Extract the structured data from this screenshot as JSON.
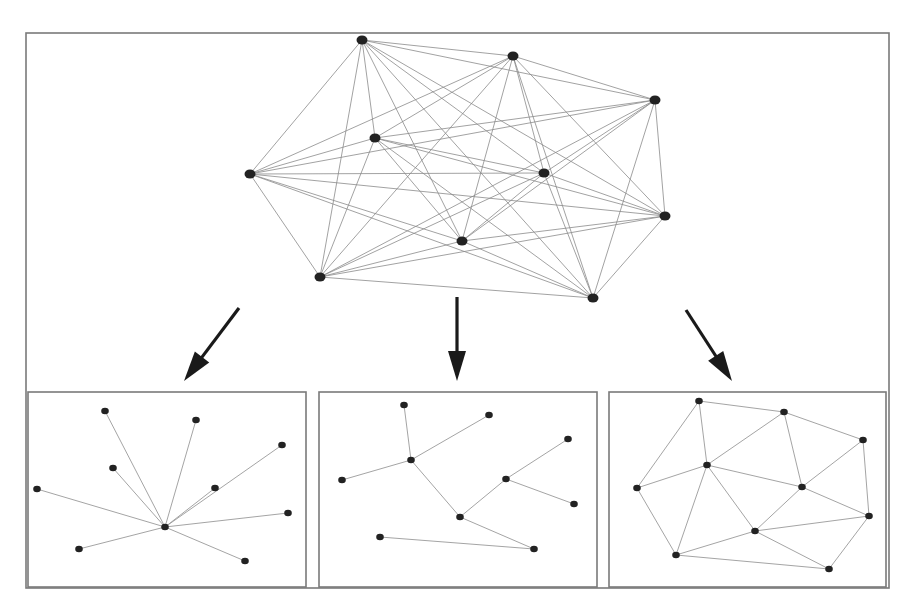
{
  "diagram": {
    "title": "",
    "colors": {
      "node": "#222222",
      "edge": "#8a8a8a",
      "frame": "#7a7a7a",
      "arrow": "#1a1a1a"
    },
    "source_graph": {
      "name": "complete-graph",
      "node_count": 10,
      "edge_type": "complete",
      "nodes": [
        {
          "id": "n0"
        },
        {
          "id": "n1"
        },
        {
          "id": "n2"
        },
        {
          "id": "n3"
        },
        {
          "id": "n4"
        },
        {
          "id": "n5"
        },
        {
          "id": "n6"
        },
        {
          "id": "n7"
        },
        {
          "id": "n8"
        },
        {
          "id": "n9"
        }
      ]
    },
    "arrows": [
      {
        "id": "arrow-left",
        "direction": "down-left",
        "target": "star-graph"
      },
      {
        "id": "arrow-middle",
        "direction": "down",
        "target": "tree-graph"
      },
      {
        "id": "arrow-right",
        "direction": "down-right",
        "target": "triangulation-graph"
      }
    ],
    "subgraphs": [
      {
        "name": "star-graph",
        "node_count": 10,
        "edges": [
          [
            0,
            1
          ],
          [
            0,
            2
          ],
          [
            0,
            3
          ],
          [
            0,
            4
          ],
          [
            0,
            5
          ],
          [
            0,
            6
          ],
          [
            0,
            7
          ],
          [
            0,
            8
          ],
          [
            0,
            9
          ]
        ]
      },
      {
        "name": "tree-graph",
        "node_count": 10,
        "edges": [
          [
            0,
            3
          ],
          [
            1,
            3
          ],
          [
            3,
            4
          ],
          [
            3,
            7
          ],
          [
            2,
            5
          ],
          [
            5,
            6
          ],
          [
            5,
            7
          ],
          [
            7,
            9
          ],
          [
            8,
            9
          ]
        ]
      },
      {
        "name": "triangulation-graph",
        "node_count": 10,
        "edges": [
          [
            0,
            1
          ],
          [
            1,
            2
          ],
          [
            0,
            3
          ],
          [
            0,
            4
          ],
          [
            1,
            3
          ],
          [
            1,
            5
          ],
          [
            2,
            5
          ],
          [
            2,
            6
          ],
          [
            3,
            4
          ],
          [
            3,
            5
          ],
          [
            3,
            7
          ],
          [
            3,
            8
          ],
          [
            4,
            8
          ],
          [
            5,
            6
          ],
          [
            5,
            7
          ],
          [
            6,
            7
          ],
          [
            6,
            9
          ],
          [
            7,
            8
          ],
          [
            7,
            9
          ],
          [
            8,
            9
          ]
        ]
      }
    ]
  }
}
